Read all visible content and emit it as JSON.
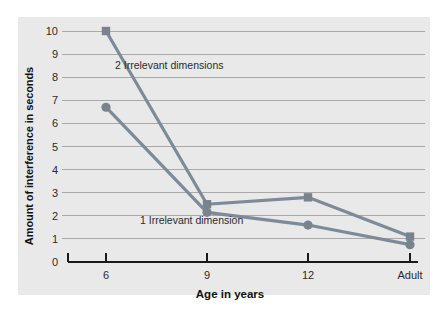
{
  "chart_data": {
    "type": "line",
    "title": "",
    "subtitle": "",
    "xlabel": "Age in years",
    "ylabel": "Amount of interference in seconds",
    "categories": [
      "6",
      "9",
      "12",
      "Adult"
    ],
    "ylim": [
      0,
      10
    ],
    "yticks": [
      0,
      1,
      2,
      3,
      4,
      5,
      6,
      7,
      8,
      9,
      10
    ],
    "ytick_labels": [
      "0",
      "1",
      "2",
      "3",
      "4",
      "5",
      "6",
      "7",
      "8",
      "9",
      "10"
    ],
    "grid": true,
    "grid_axis": "y",
    "legend_position": "inline-annotation",
    "series": [
      {
        "name": "2 Irrelevant dimensions",
        "marker": "square",
        "color": "#7d8b98",
        "values": [
          10.0,
          2.5,
          2.8,
          1.1
        ]
      },
      {
        "name": "1 Irrelevant dimension",
        "marker": "circle",
        "color": "#7d8b98",
        "values": [
          6.7,
          2.15,
          1.6,
          0.75
        ]
      }
    ],
    "annotations": [
      {
        "text": "2 Irrelevant dimensions",
        "x": "6",
        "y": 8.5
      },
      {
        "text": "1 Irrelevant dimension",
        "x": "9",
        "y": 1.4
      }
    ]
  },
  "style": {
    "panel_background": "#e9e9e9",
    "page_background": "#ffffff",
    "grid_color": "#a9a9a9",
    "axis_color": "#1a1a1a",
    "line_color": "#7d8b98",
    "marker_color": "#78838e",
    "text_color": "#2b2b2b"
  }
}
